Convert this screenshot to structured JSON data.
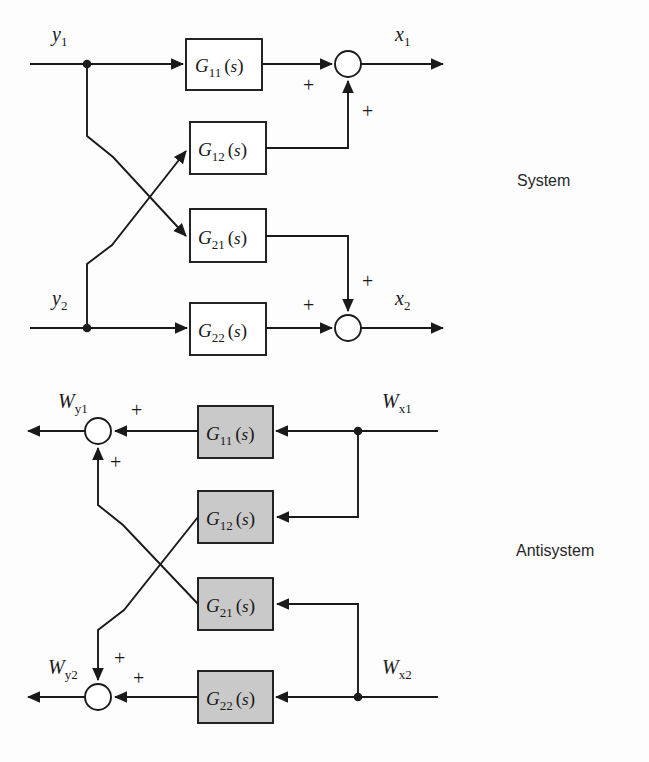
{
  "figure": {
    "type": "block-diagram",
    "background_color": "#fdfdfd",
    "line_color": "#1a1a1a",
    "shaded_block_fill": "#c9c9c9",
    "plain_block_fill": "#ffffff"
  },
  "sections": [
    {
      "id": "system",
      "label": "System",
      "label_x": 517,
      "label_y": 186
    },
    {
      "id": "antisystem",
      "label": "Antisystem",
      "label_x": 516,
      "label_y": 556
    }
  ],
  "system": {
    "name": "System",
    "flow_direction": "left-to-right",
    "inputs": [
      {
        "id": "y1",
        "base": "y",
        "sub": "1",
        "x": 52,
        "y": 41
      },
      {
        "id": "y2",
        "base": "y",
        "sub": "2",
        "x": 52,
        "y": 305
      }
    ],
    "outputs": [
      {
        "id": "x1",
        "base": "x",
        "sub": "1",
        "x": 395,
        "y": 41
      },
      {
        "id": "x2",
        "base": "x",
        "sub": "2",
        "x": 395,
        "y": 305
      }
    ],
    "blocks": [
      {
        "id": "g11",
        "base": "G",
        "sub": "11",
        "arg": "(s)",
        "x": 186,
        "y": 39,
        "w": 76,
        "h": 51,
        "shaded": false
      },
      {
        "id": "g12",
        "base": "G",
        "sub": "12",
        "arg": "(s)",
        "x": 190,
        "y": 122,
        "w": 76,
        "h": 52,
        "shaded": false
      },
      {
        "id": "g21",
        "base": "G",
        "sub": "21",
        "arg": "(s)",
        "x": 190,
        "y": 209,
        "w": 76,
        "h": 53,
        "shaded": false
      },
      {
        "id": "g22",
        "base": "G",
        "sub": "22",
        "arg": "(s)",
        "x": 190,
        "y": 303,
        "w": 76,
        "h": 52,
        "shaded": false
      }
    ],
    "summing_junctions": [
      {
        "id": "sum-x1",
        "cx": 348,
        "cy": 64,
        "r": 13
      },
      {
        "id": "sum-x2",
        "cx": 348,
        "cy": 328,
        "r": 13
      }
    ],
    "pickoff_nodes": [
      {
        "id": "node-y1",
        "cx": 87,
        "cy": 64,
        "r": 4
      },
      {
        "id": "node-y2",
        "cx": 87,
        "cy": 328,
        "r": 4
      }
    ],
    "signs": [
      {
        "id": "sum-x1-horiz-plus",
        "text": "+",
        "x": 303,
        "y": 92
      },
      {
        "id": "sum-x1-vert-plus",
        "text": "+",
        "x": 362,
        "y": 118
      },
      {
        "id": "sum-x2-vert-plus",
        "text": "+",
        "x": 362,
        "y": 288
      },
      {
        "id": "sum-x2-horiz-plus",
        "text": "+",
        "x": 303,
        "y": 312
      }
    ]
  },
  "antisystem": {
    "name": "Antisystem",
    "flow_direction": "right-to-left",
    "inputs": [
      {
        "id": "wx1",
        "base": "W",
        "sub": "x1",
        "x": 382,
        "y": 408
      },
      {
        "id": "wx2",
        "base": "W",
        "sub": "x2",
        "x": 382,
        "y": 674
      }
    ],
    "outputs": [
      {
        "id": "wy1",
        "base": "W",
        "sub": "y1",
        "x": 58,
        "y": 408
      },
      {
        "id": "wy2",
        "base": "W",
        "sub": "y2",
        "x": 48,
        "y": 674
      }
    ],
    "blocks": [
      {
        "id": "ag11",
        "base": "G",
        "sub": "11",
        "arg": "(s)",
        "x": 198,
        "y": 406,
        "w": 75,
        "h": 52,
        "shaded": true
      },
      {
        "id": "ag12",
        "base": "G",
        "sub": "12",
        "arg": "(s)",
        "x": 198,
        "y": 491,
        "w": 75,
        "h": 52,
        "shaded": true
      },
      {
        "id": "ag21",
        "base": "G",
        "sub": "21",
        "arg": "(s)",
        "x": 198,
        "y": 578,
        "w": 75,
        "h": 52,
        "shaded": true
      },
      {
        "id": "ag22",
        "base": "G",
        "sub": "22",
        "arg": "(s)",
        "x": 198,
        "y": 671,
        "w": 75,
        "h": 52,
        "shaded": true
      }
    ],
    "summing_junctions": [
      {
        "id": "sum-wy1",
        "cx": 98,
        "cy": 431,
        "r": 13
      },
      {
        "id": "sum-wy2",
        "cx": 98,
        "cy": 697,
        "r": 13
      }
    ],
    "pickoff_nodes": [
      {
        "id": "node-wx1",
        "cx": 358,
        "cy": 431,
        "r": 4
      },
      {
        "id": "node-wx2",
        "cx": 358,
        "cy": 697,
        "r": 4
      }
    ],
    "signs": [
      {
        "id": "sum-wy1-horiz-plus",
        "text": "+",
        "x": 131,
        "y": 417
      },
      {
        "id": "sum-wy1-vert-plus",
        "text": "+",
        "x": 110,
        "y": 469
      },
      {
        "id": "sum-wy2-vert-plus",
        "text": "+",
        "x": 114,
        "y": 665
      },
      {
        "id": "sum-wy2-horiz-plus",
        "text": "+",
        "x": 133,
        "y": 685
      }
    ]
  }
}
